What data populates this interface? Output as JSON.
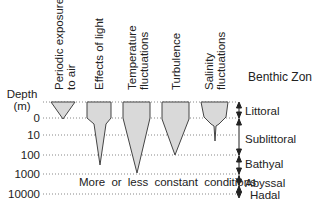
{
  "diagram": {
    "title": "Benthic Zone",
    "depth_axis": {
      "label_line1": "Depth",
      "label_line2": "(m)",
      "ticks": [
        "0",
        "10",
        "100",
        "1000",
        "10000"
      ]
    },
    "factors": [
      {
        "line1": "Periodic exposure",
        "line2": "to air"
      },
      {
        "line1": "Effects of light",
        "line2": ""
      },
      {
        "line1": "Temperature",
        "line2": "fluctuations"
      },
      {
        "line1": "Turbulence",
        "line2": ""
      },
      {
        "line1": "Salinity",
        "line2": "fluctuations"
      }
    ],
    "zones": [
      "Littoral",
      "Sublittoral",
      "Bathyal",
      "Abyssal",
      "Hadal"
    ],
    "note": "More or less constant conditions",
    "colors": {
      "fill": "#d9d9d9",
      "stroke": "#333333",
      "dotted": "#777777"
    }
  }
}
